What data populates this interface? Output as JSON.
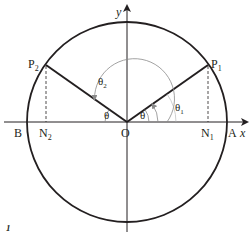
{
  "diagram": {
    "colors": {
      "stroke": "#231f20",
      "arc": "#9a9a9a",
      "background": "#ffffff"
    },
    "geometry": {
      "origin": [
        127,
        122
      ],
      "radius": 100,
      "p1": [
        208,
        65
      ],
      "p2": [
        46,
        65
      ],
      "n1": [
        208,
        122
      ],
      "n2": [
        46,
        122
      ]
    },
    "labels": {
      "y_axis": "y",
      "x_axis": "x",
      "origin": "O",
      "point_a": "A",
      "point_b": "B",
      "p1_main": "P",
      "p1_sub": "1",
      "p2_main": "P",
      "p2_sub": "2",
      "n1_main": "N",
      "n1_sub": "1",
      "n2_main": "N",
      "n2_sub": "2",
      "theta_right": "θ",
      "theta_left": "θ",
      "theta1_main": "θ",
      "theta1_sub": "1",
      "theta2_main": "θ",
      "theta2_sub": "2",
      "corner_mark": "1"
    }
  }
}
